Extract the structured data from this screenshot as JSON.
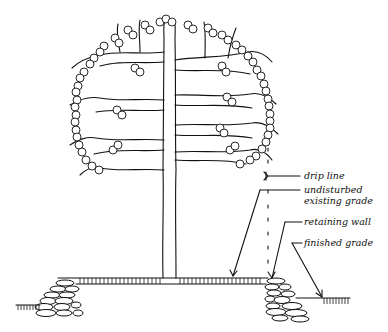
{
  "diagram": {
    "labels": {
      "drip_line": "drip line",
      "undisturbed_1": "undisturbed",
      "undisturbed_2": "existing grade",
      "retaining_wall": "retaining wall",
      "finished_grade": "finished grade"
    },
    "colors": {
      "ink": "#111111",
      "background": "#ffffff"
    }
  }
}
